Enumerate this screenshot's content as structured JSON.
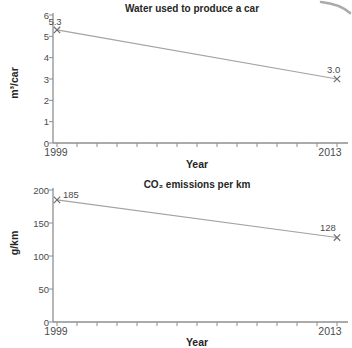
{
  "figure": {
    "background": "#ffffff",
    "corner_arc_color": "#ababab"
  },
  "style": {
    "axis_color": "#8f8f8f",
    "line_color": "#a3a3a3",
    "marker_color": "#6e6e6e",
    "text_color": "#4b4b4b",
    "title_color": "#262626"
  },
  "chart_data": [
    {
      "type": "line",
      "title": "Water used to produce a car",
      "xlabel": "Year",
      "ylabel": "m³/car",
      "x": [
        1999,
        2013
      ],
      "values": [
        5.3,
        3.0
      ],
      "point_labels": [
        "5.3",
        "3.0"
      ],
      "xtick_labels": [
        "1999",
        "2013"
      ],
      "yticks": [
        0,
        1,
        2,
        3,
        4,
        5,
        6
      ],
      "ylim": [
        0,
        6
      ],
      "xlim": [
        1999,
        2013
      ],
      "x_minor_ticks": "yearly",
      "grid": false,
      "legend": false,
      "marker": "x"
    },
    {
      "type": "line",
      "title": "CO₂ emissions per km",
      "xlabel": "Year",
      "ylabel": "g/km",
      "x": [
        1999,
        2013
      ],
      "values": [
        185,
        128
      ],
      "point_labels": [
        "185",
        "128"
      ],
      "xtick_labels": [
        "1999",
        "2013"
      ],
      "yticks": [
        0,
        50,
        100,
        150,
        200
      ],
      "ylim": [
        0,
        200
      ],
      "xlim": [
        1999,
        2013
      ],
      "x_minor_ticks": "yearly",
      "grid": false,
      "legend": false,
      "marker": "x"
    }
  ]
}
